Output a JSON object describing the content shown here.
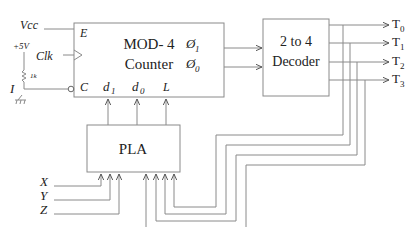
{
  "counter": {
    "title_line1": "MOD- 4",
    "title_line2": "Counter",
    "pin_enable": "E",
    "pin_clear": "C",
    "pin_d1": "d",
    "pin_d1_sub": "1",
    "pin_d0": "d",
    "pin_d0_sub": "0",
    "pin_load": "L",
    "out_q1": "Ø",
    "out_q1_sub": "1",
    "out_q0": "Ø",
    "out_q0_sub": "0"
  },
  "left_inputs": {
    "vcc": "Vcc",
    "clk": "Clk",
    "plus5v": "+5V",
    "resistor": "1k",
    "input_i": "I"
  },
  "decoder": {
    "title_line1": "2 to 4",
    "title_line2": "Decoder"
  },
  "outputs": [
    {
      "label": "T",
      "sub": "0"
    },
    {
      "label": "T",
      "sub": "1"
    },
    {
      "label": "T",
      "sub": "2"
    },
    {
      "label": "T",
      "sub": "3"
    }
  ],
  "pla": {
    "title": "PLA",
    "inputs": [
      "X",
      "Y",
      "Z"
    ]
  },
  "colors": {
    "wire": "#8a8a8a",
    "text": "#222222",
    "background": "#ffffff"
  }
}
